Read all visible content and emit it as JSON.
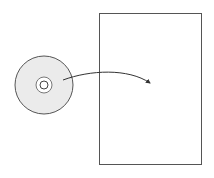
{
  "diagram": {
    "colors": {
      "background": "#ffffff",
      "stroke": "#555555",
      "disc_fill": "#ebebeb",
      "arrow": "#333333"
    },
    "disc": {
      "cx": 44,
      "cy": 85,
      "r": 29,
      "ring_r": 8,
      "hole_r": 4
    },
    "page": {
      "x": 99.5,
      "y": 13.5,
      "width": 102,
      "height": 151
    },
    "arrow": {
      "start": [
        63,
        80
      ],
      "end": [
        150,
        83
      ]
    }
  }
}
